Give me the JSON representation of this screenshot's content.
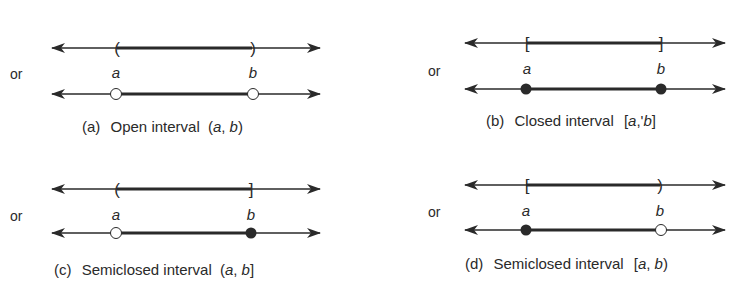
{
  "colors": {
    "ink": "#2a2a2a",
    "background": "#ffffff"
  },
  "panels": [
    {
      "id": "a",
      "or_label": "or",
      "left_label": "a",
      "right_label": "b",
      "left_bracket": "(",
      "right_bracket": ")",
      "left_endpoint": "open",
      "right_endpoint": "open",
      "caption_prefix": "(a)",
      "caption_text": "Open interval",
      "caption_notation_open": "(",
      "caption_var_a": "a",
      "caption_comma": ", ",
      "caption_var_b": "b",
      "caption_notation_close": ")"
    },
    {
      "id": "b",
      "or_label": "or",
      "left_label": "a",
      "right_label": "b",
      "left_bracket": "[",
      "right_bracket": "]",
      "left_endpoint": "closed",
      "right_endpoint": "closed",
      "caption_prefix": "(b)",
      "caption_text": "Closed interval",
      "caption_notation_open": "[",
      "caption_var_a": "a",
      "caption_comma": ",'",
      "caption_var_b": "b",
      "caption_notation_close": "]"
    },
    {
      "id": "c",
      "or_label": "or",
      "left_label": "a",
      "right_label": "b",
      "left_bracket": "(",
      "right_bracket": "]",
      "left_endpoint": "open",
      "right_endpoint": "closed",
      "caption_prefix": "(c)",
      "caption_text": "Semiclosed interval",
      "caption_notation_open": "(",
      "caption_var_a": "a",
      "caption_comma": ", ",
      "caption_var_b": "b",
      "caption_notation_close": "]"
    },
    {
      "id": "d",
      "or_label": "or",
      "left_label": "a",
      "right_label": "b",
      "left_bracket": "[",
      "right_bracket": ")",
      "left_endpoint": "closed",
      "right_endpoint": "open",
      "caption_prefix": "(d)",
      "caption_text": "Semiclosed interval",
      "caption_notation_open": "[",
      "caption_var_a": "a",
      "caption_comma": ", ",
      "caption_var_b": "b",
      "caption_notation_close": ")"
    }
  ]
}
